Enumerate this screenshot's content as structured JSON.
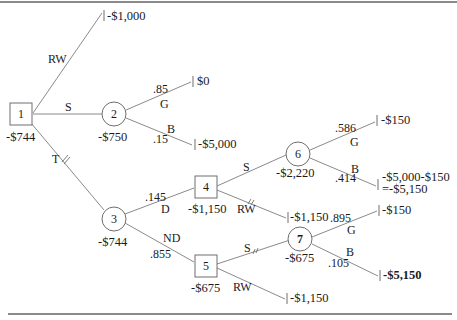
{
  "diagram": {
    "type": "decision-tree",
    "nodes": [
      {
        "id": "1",
        "kind": "decision",
        "label": "1",
        "value": "-$744"
      },
      {
        "id": "2",
        "kind": "chance",
        "label": "2",
        "value": "-$750"
      },
      {
        "id": "3",
        "kind": "chance",
        "label": "3",
        "value": "-$744"
      },
      {
        "id": "4",
        "kind": "decision",
        "label": "4",
        "value": "-$1,150"
      },
      {
        "id": "5",
        "kind": "decision",
        "label": "5",
        "value": "-$675"
      },
      {
        "id": "6",
        "kind": "chance",
        "label": "6",
        "value": "-$2,220"
      },
      {
        "id": "7",
        "kind": "chance",
        "label": "7",
        "value": "-$675"
      }
    ],
    "edges": {
      "n1_rw": {
        "label": "RW"
      },
      "n1_s": {
        "label": "S"
      },
      "n1_t": {
        "label": "T"
      },
      "n2_g": {
        "label": "G",
        "prob": ".85"
      },
      "n2_b": {
        "label": "B",
        "prob": ".15"
      },
      "n3_d": {
        "label": "D",
        "prob": ".145"
      },
      "n3_nd": {
        "label": "ND",
        "prob": ".855"
      },
      "n4_s": {
        "label": "S"
      },
      "n4_rw": {
        "label": "RW"
      },
      "n5_s": {
        "label": "S"
      },
      "n5_rw": {
        "label": "RW"
      },
      "n6_g": {
        "label": "G",
        "prob": ".586"
      },
      "n6_b": {
        "label": "B",
        "prob": ".414"
      },
      "n7_g": {
        "label": "G",
        "prob": ".895"
      },
      "n7_b": {
        "label": "B",
        "prob": ".105"
      }
    },
    "terminals": {
      "t1_rw": "-$1,000",
      "t2_g": "$0",
      "t2_b": "-$5,000",
      "t4_rw": "-$1,150",
      "t5_rw": "-$1,150",
      "t6_g": "-$150",
      "t6_b_line1": "-$5,000-$150",
      "t6_b_line2": "=-$5,150",
      "t7_g": "-$150",
      "t7_b": "-$5,150"
    }
  }
}
